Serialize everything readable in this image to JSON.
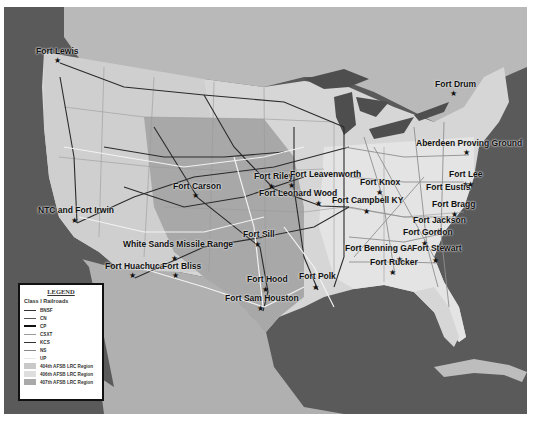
{
  "map": {
    "title": "Continental US Class I Railroads and AFSB LRC Regions",
    "colors": {
      "water": "#5a5a5a",
      "land_outside": "#b4b4b4",
      "region_404": "#bcbcbc",
      "region_406": "#d8d8d8",
      "region_407": "#a6a6a6",
      "rail_dark": "#2a2a2a",
      "rail_light": "#f0f0f0"
    },
    "installations": [
      {
        "name": "Fort Lewis",
        "label_x": 36,
        "label_y": 47,
        "star_x": 56,
        "star_y": 56
      },
      {
        "name": "Fort Drum",
        "label_x": 435,
        "label_y": 80,
        "star_x": 452,
        "star_y": 89
      },
      {
        "name": "Aberdeen Proving Ground",
        "label_x": 416,
        "label_y": 139,
        "star_x": 465,
        "star_y": 148
      },
      {
        "name": "Fort Carson",
        "label_x": 173,
        "label_y": 182,
        "star_x": 194,
        "star_y": 191
      },
      {
        "name": "Fort Riley",
        "label_x": 254,
        "label_y": 172,
        "star_x": 270,
        "star_y": 182
      },
      {
        "name": "Fort Leavenworth",
        "label_x": 290,
        "label_y": 170,
        "star_x": 290,
        "star_y": 181
      },
      {
        "name": "Fort Leonard Wood",
        "label_x": 259,
        "label_y": 189,
        "star_x": 317,
        "star_y": 199
      },
      {
        "name": "Fort Knox",
        "label_x": 360,
        "label_y": 178,
        "star_x": 378,
        "star_y": 188
      },
      {
        "name": "Fort Campbell KY",
        "label_x": 332,
        "label_y": 196,
        "star_x": 365,
        "star_y": 207
      },
      {
        "name": "Fort Lee",
        "label_x": 449,
        "label_y": 170,
        "star_x": 464,
        "star_y": 180
      },
      {
        "name": "Fort Eustis",
        "label_x": 426,
        "label_y": 183,
        "star_x": 469,
        "star_y": 180
      },
      {
        "name": "Fort Bragg",
        "label_x": 432,
        "label_y": 200,
        "star_x": 453,
        "star_y": 210
      },
      {
        "name": "NTC and Fort Irwin",
        "label_x": 38,
        "label_y": 206,
        "star_x": 73,
        "star_y": 216
      },
      {
        "name": "Fort Jackson",
        "label_x": 413,
        "label_y": 216,
        "star_x": 437,
        "star_y": 227
      },
      {
        "name": "Fort Gordon",
        "label_x": 403,
        "label_y": 228,
        "star_x": 423,
        "star_y": 239
      },
      {
        "name": "Fort Sill",
        "label_x": 243,
        "label_y": 230,
        "star_x": 256,
        "star_y": 240
      },
      {
        "name": "White Sands Missile Range",
        "label_x": 123,
        "label_y": 240,
        "star_x": 173,
        "star_y": 254
      },
      {
        "name": "Fort Benning GA",
        "label_x": 345,
        "label_y": 244,
        "star_x": 398,
        "star_y": 255
      },
      {
        "name": "Fort Stewart",
        "label_x": 412,
        "label_y": 244,
        "star_x": 434,
        "star_y": 256
      },
      {
        "name": "Fort Huachuca",
        "label_x": 105,
        "label_y": 262,
        "star_x": 131,
        "star_y": 271
      },
      {
        "name": "Fort Bliss",
        "label_x": 162,
        "label_y": 262,
        "star_x": 174,
        "star_y": 271
      },
      {
        "name": "Fort Rucker",
        "label_x": 370,
        "label_y": 258,
        "star_x": 391,
        "star_y": 268
      },
      {
        "name": "Fort Hood",
        "label_x": 247,
        "label_y": 275,
        "star_x": 264,
        "star_y": 285
      },
      {
        "name": "Fort Polk",
        "label_x": 299,
        "label_y": 272,
        "star_x": 314,
        "star_y": 283
      },
      {
        "name": "Fort Sam Houston",
        "label_x": 225,
        "label_y": 294,
        "star_x": 259,
        "star_y": 304
      }
    ]
  },
  "legend": {
    "title": "LEGEND",
    "subtitle": "Class I Railroads",
    "railroads": [
      {
        "name": "BNSF",
        "color": "#333333",
        "width": 1.2
      },
      {
        "name": "CN",
        "color": "#555555",
        "width": 1.2
      },
      {
        "name": "CP",
        "color": "#111111",
        "width": 2
      },
      {
        "name": "CSXT",
        "color": "#999999",
        "width": 1.4
      },
      {
        "name": "KCS",
        "color": "#333333",
        "width": 1.2
      },
      {
        "name": "NS",
        "color": "#888888",
        "width": 1.2
      },
      {
        "name": "UP",
        "color": "#eeeeee",
        "width": 1.6
      }
    ],
    "regions": [
      {
        "name": "404th AFSB LRC Region",
        "color": "#c9c9c9"
      },
      {
        "name": "406th AFSB LRC Region",
        "color": "#dedede"
      },
      {
        "name": "407th AFSB LRC Region",
        "color": "#a9a9a9"
      }
    ]
  }
}
